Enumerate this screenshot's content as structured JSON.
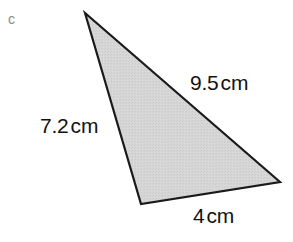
{
  "figure": {
    "part_label": "c",
    "shape": "triangle",
    "background_color": "#ffffff",
    "fill_color": "#d4d4d4",
    "stroke_color": "#1a1a1a",
    "label_color": "#121212",
    "part_label_color": "#8a8a8a",
    "stroke_width": 2.2,
    "vertices": [
      {
        "name": "apex",
        "x": 85,
        "y": 13
      },
      {
        "name": "bottom-left",
        "x": 141,
        "y": 204
      },
      {
        "name": "right",
        "x": 280,
        "y": 182
      }
    ],
    "side_labels": [
      {
        "name": "hypotenuse",
        "value": "9.5",
        "unit": "cm",
        "between": [
          "apex",
          "right"
        ]
      },
      {
        "name": "left-side",
        "value": "7.2",
        "unit": "cm",
        "between": [
          "apex",
          "bottom-left"
        ]
      },
      {
        "name": "base",
        "value": "4",
        "unit": "cm",
        "between": [
          "bottom-left",
          "right"
        ]
      }
    ]
  }
}
